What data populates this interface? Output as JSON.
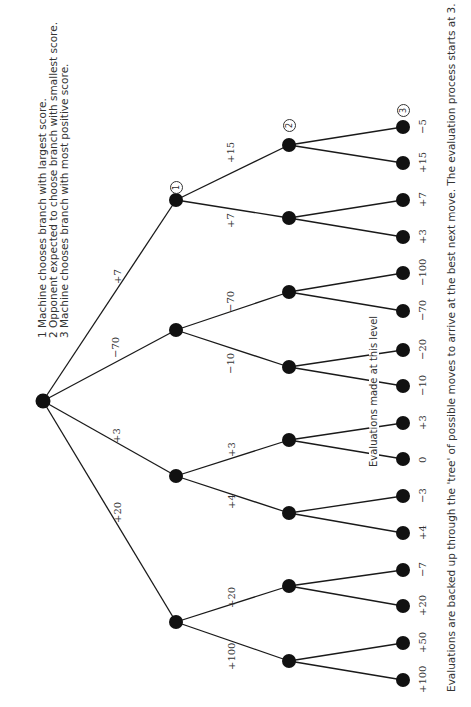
{
  "legend": {
    "items": [
      "1  Machine chooses branch with largest score.",
      "2  Opponent expected to choose branch with smallest score.",
      "3  Machine chooses branch with most positive score."
    ]
  },
  "caption": "Evaluations are backed up through the 'tree' of possible moves to arrive at the best next move. The evaluation process starts at 3.",
  "level_label": "Evaluations made at this level",
  "markers": [
    "1",
    "2",
    "3"
  ],
  "tree": {
    "root_edges": [
      "+7",
      "−70",
      "+3",
      "+20"
    ],
    "level2_edges": [
      "+15",
      "+7",
      "−70",
      "−10",
      "+3",
      "+4",
      "+20",
      "+100"
    ],
    "leaf_values": [
      "−5",
      "+15",
      "+7",
      "+3",
      "−100",
      "−70",
      "−20",
      "−10",
      "+3",
      "0",
      "−3",
      "+4",
      "−7",
      "+20",
      "+50",
      "+100"
    ]
  }
}
